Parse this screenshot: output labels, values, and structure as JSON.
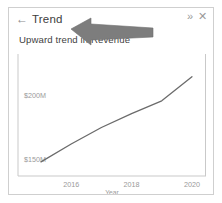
{
  "panel": {
    "title": "Trend",
    "back_icon": "←",
    "expand_icon": "»",
    "close_icon": "✕",
    "subtitle": "Upward trend in Revenue"
  },
  "chart_data": {
    "type": "line",
    "title": "",
    "xlabel": "Year",
    "ylabel": "",
    "x": [
      2015,
      2016,
      2017,
      2018,
      2019,
      2020
    ],
    "values": [
      148,
      162,
      175,
      186,
      196,
      215
    ],
    "x_ticks": [
      "2016",
      "2018",
      "2020"
    ],
    "y_ticks": [
      "$200M",
      "$150M"
    ],
    "ylim": [
      140,
      225
    ],
    "xlim": [
      2015,
      2020.3
    ],
    "grid": false,
    "legend": null,
    "line_color": "#6b6b6b",
    "axis_color": "#c8c8c8",
    "tick_label_color": "#9a9a9a"
  },
  "annotation": {
    "cursor": "mouse-pointer-arrow",
    "color": "#7d7d7d"
  }
}
